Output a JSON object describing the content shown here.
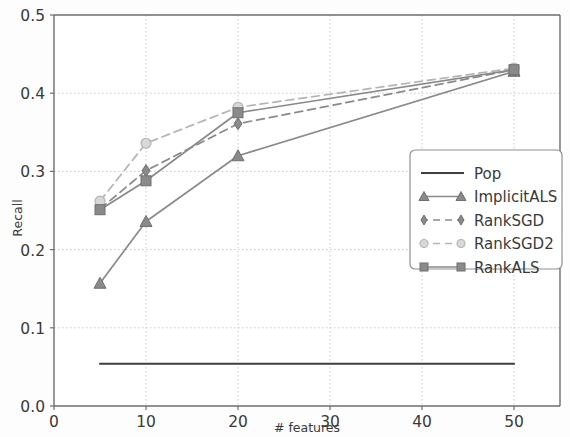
{
  "chart_data": {
    "type": "line",
    "title": "",
    "xlabel": "# features",
    "ylabel": "Recall",
    "xlim": [
      0,
      55
    ],
    "ylim": [
      0.0,
      0.5
    ],
    "xticks": [
      0,
      10,
      20,
      30,
      40,
      50
    ],
    "xtick_labels": [
      "0",
      "10",
      "20",
      "30",
      "40",
      "50"
    ],
    "yticks": [
      0.0,
      0.1,
      0.2,
      0.3,
      0.4,
      0.5
    ],
    "ytick_labels": [
      "0.0",
      "0.1",
      "0.2",
      "0.3",
      "0.4",
      "0.5"
    ],
    "grid": true,
    "grid_style": "dotted",
    "legend_position": "lower-right",
    "x": [
      5,
      10,
      20,
      50
    ],
    "series": [
      {
        "name": "Pop",
        "marker": "none",
        "linestyle": "solid",
        "color": "#3f3f3f",
        "x": [
          5,
          50
        ],
        "values": [
          0.054,
          0.054
        ]
      },
      {
        "name": "ImplicitALS",
        "marker": "triangle",
        "linestyle": "solid",
        "color": "#8a8a8a",
        "x": [
          5,
          10,
          20,
          50
        ],
        "values": [
          0.157,
          0.236,
          0.32,
          0.428
        ]
      },
      {
        "name": "RankSGD",
        "marker": "diamond",
        "linestyle": "dashed",
        "color": "#8a8a8a",
        "x": [
          5,
          10,
          20,
          50
        ],
        "values": [
          0.252,
          0.301,
          0.361,
          0.43
        ]
      },
      {
        "name": "RankSGD2",
        "marker": "circle",
        "linestyle": "dashed",
        "color": "#b4b4b4",
        "x": [
          5,
          10,
          20,
          50
        ],
        "values": [
          0.262,
          0.336,
          0.382,
          0.432
        ]
      },
      {
        "name": "RankALS",
        "marker": "square",
        "linestyle": "solid",
        "color": "#8a8a8a",
        "x": [
          5,
          10,
          20,
          50
        ],
        "values": [
          0.251,
          0.288,
          0.375,
          0.43
        ]
      }
    ]
  },
  "axes": {
    "xlabel": "# features",
    "ylabel": "Recall"
  },
  "legend": {
    "items": [
      {
        "label": "Pop"
      },
      {
        "label": "ImplicitALS"
      },
      {
        "label": "RankSGD"
      },
      {
        "label": "RankSGD2"
      },
      {
        "label": "RankALS"
      }
    ]
  }
}
